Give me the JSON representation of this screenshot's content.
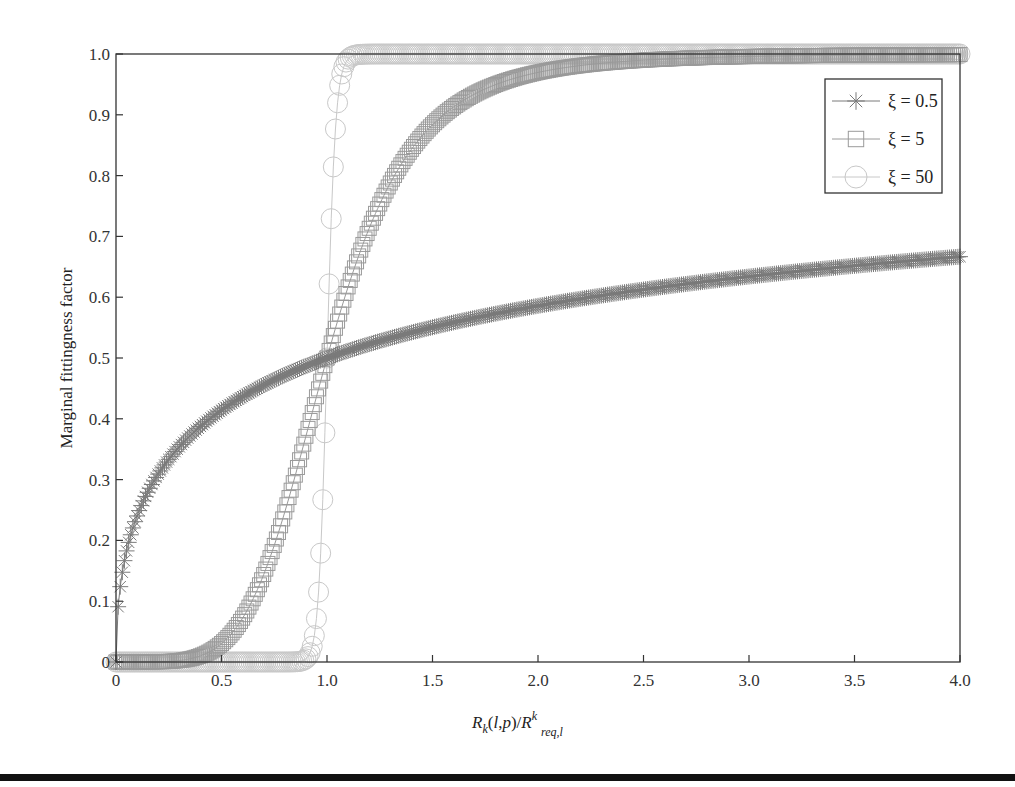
{
  "chart_data": {
    "type": "scatter",
    "title": "",
    "xlabel": "R_k(l,p)/R^k_req,l",
    "xlabel_parts": {
      "r1": "R",
      "s1": "k",
      "m1": "(",
      "l": "l",
      "c": ",",
      "p": "p",
      "m2": ")/",
      "r2": "R",
      "s2": "k",
      "s3": "req,l"
    },
    "ylabel": "Marginal fittingness factor",
    "xlim": [
      0,
      4.0
    ],
    "ylim": [
      0,
      1.0
    ],
    "xticks": [
      0,
      0.5,
      1.0,
      1.5,
      2.0,
      2.5,
      3.0,
      3.5,
      4.0
    ],
    "xtick_labels": [
      "0",
      "0.5",
      "1.0",
      "1.5",
      "2.0",
      "2.5",
      "3.0",
      "3.5",
      "4.0"
    ],
    "yticks": [
      0,
      0.1,
      0.2,
      0.3,
      0.4,
      0.5,
      0.6,
      0.7,
      0.8,
      0.9,
      1.0
    ],
    "ytick_labels": [
      "0",
      "0.1",
      "0.2",
      "0.3",
      "0.4",
      "0.5",
      "0.6",
      "0.7",
      "0.8",
      "0.9",
      "1.0"
    ],
    "grid": false,
    "legend_position": "top-right",
    "function": "y = x^xi / (1 + x^xi)",
    "x_sampling": {
      "start": 0,
      "stop": 4.0,
      "step": 0.01
    },
    "series": [
      {
        "name": "ξ = 0.5",
        "xi": 0.5,
        "marker": "asterisk",
        "color": "#7a7a7a",
        "sample_points": [
          [
            0,
            0
          ],
          [
            0.01,
            0.0909
          ],
          [
            0.1,
            0.24
          ],
          [
            0.5,
            0.414
          ],
          [
            1.0,
            0.5
          ],
          [
            1.5,
            0.551
          ],
          [
            2.0,
            0.586
          ],
          [
            2.5,
            0.613
          ],
          [
            3.0,
            0.634
          ],
          [
            3.5,
            0.652
          ],
          [
            4.0,
            0.667
          ]
        ]
      },
      {
        "name": "ξ = 5",
        "xi": 5,
        "marker": "square",
        "color": "#9a9a9a",
        "sample_points": [
          [
            0,
            0
          ],
          [
            0.5,
            0.03
          ],
          [
            0.75,
            0.192
          ],
          [
            1.0,
            0.5
          ],
          [
            1.25,
            0.753
          ],
          [
            1.5,
            0.884
          ],
          [
            2.0,
            0.97
          ],
          [
            2.5,
            0.99
          ],
          [
            3.0,
            0.996
          ],
          [
            4.0,
            0.999
          ]
        ]
      },
      {
        "name": "ξ = 50",
        "xi": 50,
        "marker": "circle",
        "color": "#c8c8c8",
        "sample_points": [
          [
            0,
            0
          ],
          [
            0.9,
            0.005
          ],
          [
            0.95,
            0.071
          ],
          [
            1.0,
            0.5
          ],
          [
            1.05,
            0.92
          ],
          [
            1.1,
            0.992
          ],
          [
            1.5,
            1.0
          ],
          [
            4.0,
            1.0
          ]
        ]
      }
    ]
  }
}
